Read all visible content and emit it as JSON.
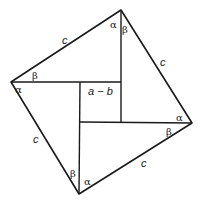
{
  "diagram": {
    "vertices": {
      "top": [
        121,
        10
      ],
      "right": [
        192,
        123
      ],
      "bottom": [
        79,
        194
      ],
      "left": [
        11,
        82
      ]
    },
    "inner_square": {
      "x": 80,
      "y": 82,
      "width": 41,
      "height": 40,
      "label": "a − b"
    },
    "side_labels": [
      {
        "id": "c-top-left",
        "text": "c",
        "x": 63,
        "y": 44
      },
      {
        "id": "c-top-right",
        "text": "c",
        "x": 162,
        "y": 66
      },
      {
        "id": "c-bottom-left",
        "text": "c",
        "x": 35,
        "y": 143
      },
      {
        "id": "c-bottom-right",
        "text": "c",
        "x": 143,
        "y": 167
      }
    ],
    "angle_labels": [
      {
        "id": "alpha-top",
        "text": "α",
        "x": 111,
        "y": 28
      },
      {
        "id": "beta-top",
        "text": "β",
        "x": 123,
        "y": 32
      },
      {
        "id": "beta-left",
        "text": "β",
        "x": 32,
        "y": 79
      },
      {
        "id": "alpha-left",
        "text": "α",
        "x": 17,
        "y": 93
      },
      {
        "id": "alpha-right",
        "text": "α",
        "x": 177,
        "y": 121
      },
      {
        "id": "beta-right",
        "text": "β",
        "x": 167,
        "y": 134
      },
      {
        "id": "beta-bottom",
        "text": "β",
        "x": 71,
        "y": 177
      },
      {
        "id": "alpha-bottom",
        "text": "α",
        "x": 84,
        "y": 185
      }
    ],
    "colors": {
      "stroke": "#1a1a1a",
      "background": "#ffffff"
    }
  }
}
